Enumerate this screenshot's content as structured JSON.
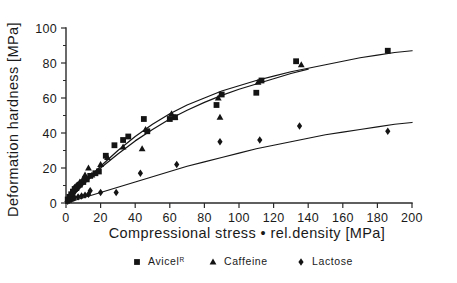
{
  "chart_data": {
    "type": "scatter",
    "title": "",
    "xlabel": "Compressional stress • rel.density [MPa]",
    "ylabel": "Deformation hardness [MPa]",
    "xlim": [
      0,
      200
    ],
    "ylim": [
      0,
      100
    ],
    "xticks": [
      0,
      20,
      40,
      60,
      80,
      100,
      120,
      140,
      160,
      180,
      200
    ],
    "xticklabels": [
      "0",
      "20",
      "40",
      "60",
      "80",
      "100",
      "120",
      "140",
      "160",
      "180",
      "200"
    ],
    "yticks": [
      0,
      20,
      40,
      60,
      80,
      100
    ],
    "yticklabels": [
      "0",
      "20",
      "40",
      "60",
      "80",
      "100"
    ],
    "y_minor_ticks": [
      10,
      30,
      50,
      70,
      90
    ],
    "grid": false,
    "legend_position": "below-axes",
    "series": [
      {
        "name": "Avicel",
        "name_superscript": "R",
        "marker": "square",
        "points": [
          [
            1,
            2
          ],
          [
            2,
            3.5
          ],
          [
            3,
            5
          ],
          [
            4,
            6.5
          ],
          [
            5,
            8
          ],
          [
            6,
            8.5
          ],
          [
            8,
            10.5
          ],
          [
            10,
            12
          ],
          [
            12,
            13.5
          ],
          [
            14,
            15.5
          ],
          [
            17,
            17
          ],
          [
            19,
            18
          ],
          [
            23,
            27
          ],
          [
            28,
            33
          ],
          [
            33,
            36
          ],
          [
            36,
            38
          ],
          [
            45,
            48
          ],
          [
            47,
            41
          ],
          [
            60,
            48
          ],
          [
            63,
            49
          ],
          [
            87,
            56
          ],
          [
            90,
            62
          ],
          [
            110,
            63
          ],
          [
            113,
            70
          ],
          [
            133,
            81
          ],
          [
            186,
            87
          ]
        ],
        "fit_curve": [
          [
            0,
            0
          ],
          [
            10,
            11
          ],
          [
            20,
            21
          ],
          [
            30,
            30
          ],
          [
            40,
            38
          ],
          [
            50,
            45
          ],
          [
            60,
            51
          ],
          [
            70,
            56
          ],
          [
            80,
            60
          ],
          [
            90,
            64
          ],
          [
            100,
            67
          ],
          [
            110,
            70
          ],
          [
            120,
            72.5
          ],
          [
            130,
            75
          ],
          [
            140,
            77
          ],
          [
            150,
            79
          ],
          [
            160,
            81
          ],
          [
            170,
            83
          ],
          [
            180,
            84.5
          ],
          [
            190,
            86
          ],
          [
            200,
            87
          ]
        ]
      },
      {
        "name": "Caffeine",
        "marker": "triangle",
        "points": [
          [
            1,
            2
          ],
          [
            2,
            4
          ],
          [
            3,
            5.5
          ],
          [
            4,
            7
          ],
          [
            5,
            9
          ],
          [
            6,
            10
          ],
          [
            8,
            12
          ],
          [
            10,
            14
          ],
          [
            11,
            16
          ],
          [
            13,
            20
          ],
          [
            15,
            16
          ],
          [
            18,
            18
          ],
          [
            20,
            22
          ],
          [
            24,
            26
          ],
          [
            33,
            32
          ],
          [
            44,
            31
          ],
          [
            46,
            42
          ],
          [
            61,
            51
          ],
          [
            63,
            49
          ],
          [
            88,
            60
          ],
          [
            89,
            49
          ],
          [
            111,
            69
          ],
          [
            136,
            79
          ]
        ],
        "fit_curve": [
          [
            0,
            0
          ],
          [
            10,
            10.5
          ],
          [
            20,
            20
          ],
          [
            30,
            28
          ],
          [
            40,
            35.5
          ],
          [
            50,
            42
          ],
          [
            60,
            48
          ],
          [
            70,
            53
          ],
          [
            80,
            57.5
          ],
          [
            90,
            61.5
          ],
          [
            100,
            65
          ],
          [
            110,
            68
          ],
          [
            120,
            71
          ],
          [
            130,
            74
          ],
          [
            140,
            76.5
          ]
        ]
      },
      {
        "name": "Lactose",
        "marker": "diamond",
        "points": [
          [
            1,
            1
          ],
          [
            2,
            1.5
          ],
          [
            3,
            2
          ],
          [
            4,
            2.5
          ],
          [
            5,
            3
          ],
          [
            7,
            3.5
          ],
          [
            9,
            4
          ],
          [
            11,
            4.5
          ],
          [
            13,
            5
          ],
          [
            14,
            7
          ],
          [
            20,
            6
          ],
          [
            29,
            6
          ],
          [
            43,
            17
          ],
          [
            64,
            22
          ],
          [
            89,
            35
          ],
          [
            112,
            36
          ],
          [
            135,
            44
          ],
          [
            186,
            41
          ]
        ],
        "fit_curve": [
          [
            0,
            0
          ],
          [
            10,
            3
          ],
          [
            20,
            6
          ],
          [
            30,
            9
          ],
          [
            40,
            12
          ],
          [
            50,
            15
          ],
          [
            60,
            18
          ],
          [
            70,
            21
          ],
          [
            80,
            23.5
          ],
          [
            90,
            26
          ],
          [
            100,
            28.5
          ],
          [
            110,
            31
          ],
          [
            120,
            33
          ],
          [
            130,
            35
          ],
          [
            140,
            37
          ],
          [
            150,
            39
          ],
          [
            160,
            40.5
          ],
          [
            170,
            42
          ],
          [
            180,
            43.5
          ],
          [
            190,
            45
          ],
          [
            200,
            46
          ]
        ]
      }
    ],
    "legend": [
      {
        "label": "Avicel",
        "superscript": "R",
        "marker": "square"
      },
      {
        "label": "Caffeine",
        "superscript": "",
        "marker": "triangle"
      },
      {
        "label": "Lactose",
        "superscript": "",
        "marker": "diamond"
      }
    ],
    "colors": {
      "marker": "#141414",
      "line": "#151515",
      "axis": "#2b2b2b",
      "background": "#ffffff"
    }
  }
}
